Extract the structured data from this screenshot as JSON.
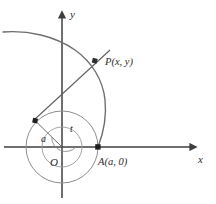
{
  "figure": {
    "kind": "involute-of-circle-diagram",
    "background_color": "#ffffff",
    "width": 216,
    "height": 204
  },
  "axes": {
    "x_label": "x",
    "y_label": "y",
    "origin_label": "O",
    "axis_color": "#3a3a3a",
    "arrowheads": [
      "x-axis-arrow",
      "y-axis-arrow"
    ]
  },
  "labels": {
    "point_p": "P(x, y)",
    "point_a": "A(a, 0)",
    "radius": "a",
    "angle": "t"
  },
  "geometry": {
    "origin": {
      "x": 62,
      "y": 147
    },
    "circle_radius": 36,
    "inner_arc_radius": 20,
    "angle_arc_radius": 14,
    "point_a": {
      "x": 98,
      "y": 147
    },
    "tangent_point": {
      "x": 35.5,
      "y": 121
    },
    "point_p": {
      "x": 95,
      "y": 61
    },
    "angle_t_degrees": 137
  },
  "colors": {
    "curve": "#6e6e6e",
    "circle": "#8a8a8a",
    "axis": "#3f3f3f",
    "marker": "#1f1f1f",
    "text": "#2b2b2b",
    "background": "#ffffff"
  },
  "elements": {
    "involute_curve": "involute-spiral-curve",
    "base_circle": "base-circle",
    "inner_circle_arc": "inner-circle-arc",
    "angle_arc": "angle-arc-t",
    "radius_segment": "radius-segment-a",
    "tangent_segment": "tangent-line-segment",
    "marker_a": "point-marker-a",
    "marker_p": "point-marker-p",
    "marker_tangent": "point-marker-tangent"
  }
}
